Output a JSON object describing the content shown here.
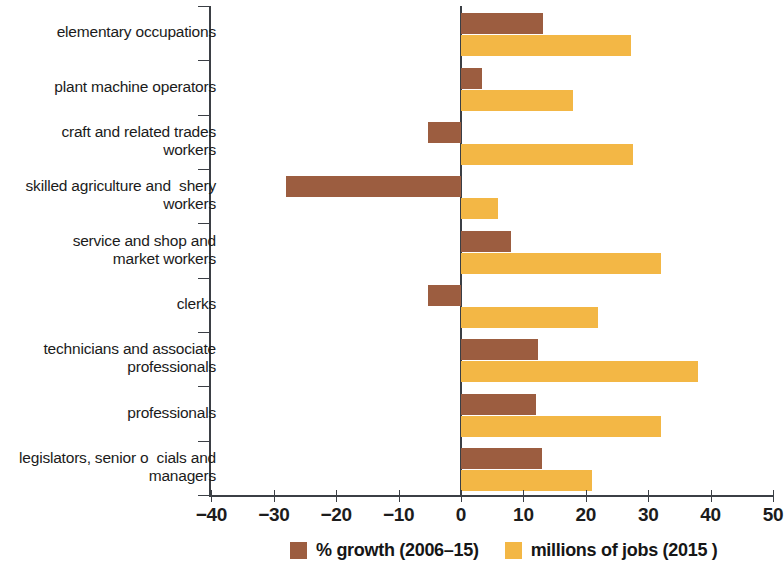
{
  "chart_data": {
    "type": "bar",
    "orientation": "horizontal",
    "title": "",
    "xlabel": "",
    "ylabel": "",
    "xlim": [
      -40,
      50
    ],
    "xticks": [
      -40,
      -30,
      -20,
      -10,
      0,
      10,
      20,
      30,
      40,
      50
    ],
    "xtick_labels": [
      "−40",
      "−30",
      "−20",
      "−10",
      "0",
      "10",
      "20",
      "30",
      "40",
      "50"
    ],
    "grid": false,
    "legend_position": "bottom",
    "categories": [
      "elementary occupations",
      "plant machine operators",
      "craft and related trades\nworkers",
      "skilled agriculture and  shery\nworkers",
      "service and shop and\nmarket workers",
      "clerks",
      "technicians and associate\nprofessionals",
      "professionals",
      "legislators, senior o  cials and\nmanagers"
    ],
    "series": [
      {
        "name": "% growth (2006–15)",
        "color": "#9c5d40",
        "values": [
          13.2,
          3.4,
          -5.3,
          -28.0,
          8.0,
          -5.3,
          12.3,
          12.0,
          13.0
        ]
      },
      {
        "name": "millions of jobs (2015 )",
        "color": "#f3b745",
        "values": [
          27.2,
          18.0,
          27.6,
          6.0,
          32.0,
          22.0,
          38.0,
          32.0,
          21.0
        ]
      }
    ],
    "legend": [
      {
        "label": "% growth (2006–15)",
        "color": "#9c5d40",
        "swatch": "legend-swatch-growth"
      },
      {
        "label": "millions of jobs (2015 )",
        "color": "#f3b745",
        "swatch": "legend-swatch-jobs"
      }
    ]
  }
}
